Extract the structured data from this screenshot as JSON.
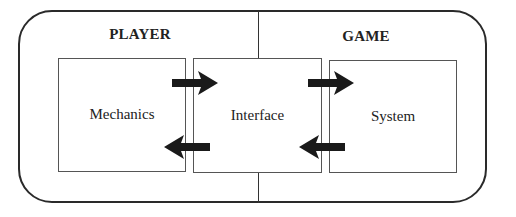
{
  "diagram": {
    "type": "block-flow",
    "sections": [
      {
        "label": "PLAYER"
      },
      {
        "label": "GAME"
      }
    ],
    "boxes": [
      {
        "id": "mechanics",
        "label": "Mechanics",
        "section": "PLAYER"
      },
      {
        "id": "interface",
        "label": "Interface",
        "section": "shared"
      },
      {
        "id": "system",
        "label": "System",
        "section": "GAME"
      }
    ],
    "edges": [
      {
        "from": "mechanics",
        "to": "interface",
        "direction": "right"
      },
      {
        "from": "interface",
        "to": "system",
        "direction": "right"
      },
      {
        "from": "system",
        "to": "interface",
        "direction": "left"
      },
      {
        "from": "interface",
        "to": "mechanics",
        "direction": "left"
      }
    ],
    "colors": {
      "stroke": "#2a2a2a",
      "arrow_fill": "#1a1a1a",
      "background": "#ffffff"
    }
  }
}
